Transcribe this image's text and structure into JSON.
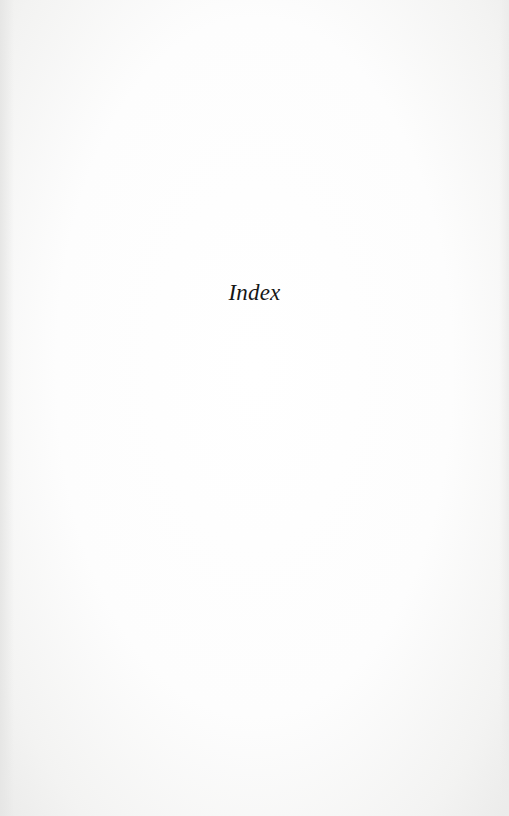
{
  "page": {
    "title": "Index"
  }
}
